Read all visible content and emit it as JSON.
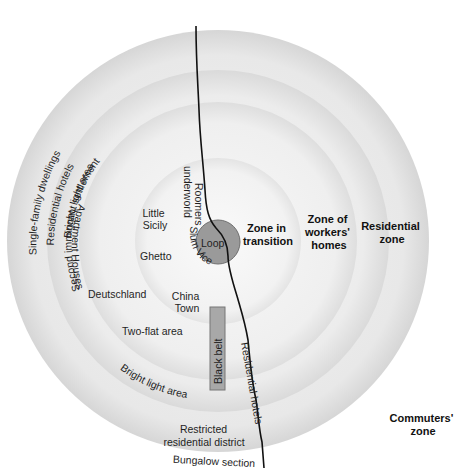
{
  "diagram": {
    "colors": {
      "background": "#ffffff",
      "ring_commuters_edge": "#d2d2d2",
      "ring_residential": "#e6e6e6",
      "ring_workers": "#ececec",
      "ring_transition": "#f3f3f3",
      "loop_fill": "#9a9a9a",
      "loop_stroke": "#6e6e6e",
      "black_belt_fill": "#a8a8a8",
      "black_belt_stroke": "#777777",
      "river": "#111111"
    },
    "zones": {
      "loop": "Loop",
      "transition": [
        "Zone in",
        "transition"
      ],
      "workers": [
        "Zone of",
        "workers'",
        "homes"
      ],
      "residential": [
        "Residential",
        "zone"
      ],
      "commuters": [
        "Commuters'",
        "zone"
      ]
    },
    "labels": {
      "single_family": "Single-family dwellings",
      "residential_hotels_outer": "Residential hotels",
      "bright_light_area_top": "Bright, light area",
      "second_immigrant": "Second immigrant settlement",
      "roomers": "Roomers",
      "underworld": "underworld",
      "little": "Little",
      "sicily": "Sicily",
      "ghetto": "Ghetto",
      "slum_vice": "Slum Vice",
      "deutschland": "Deutschland",
      "china": "China",
      "town": "Town",
      "two_flat": "Two-flat area",
      "black_belt": "Black belt",
      "apartment_houses": "Apartment Houses",
      "bright_light_area_bottom": "Bright light area",
      "residential_hotels_inner": "Residential hotels",
      "restricted": "Restricted",
      "residential_district": "residential district",
      "bungalow": "Bungalow section"
    }
  }
}
